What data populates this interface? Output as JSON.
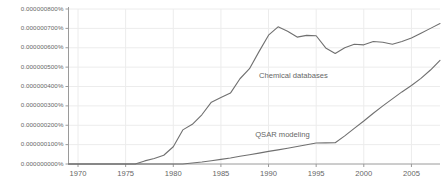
{
  "chart_data": {
    "type": "line",
    "title": "",
    "subtitle": "",
    "xlabel": "",
    "ylabel": "",
    "grid": true,
    "legend_position": "inline-annotation",
    "xlim": [
      1969,
      2008
    ],
    "ylim": [
      0.0,
      8e-07
    ],
    "x_ticks": [
      1970,
      1975,
      1980,
      1985,
      1990,
      1995,
      2000,
      2005
    ],
    "x_tick_labels": [
      "1970",
      "1975",
      "1980",
      "1985",
      "1990",
      "1995",
      "2000",
      "2005"
    ],
    "y_ticks": [
      0.0,
      1e-07,
      2e-07,
      3e-07,
      4e-07,
      5e-07,
      6e-07,
      7e-07,
      8e-07
    ],
    "y_tick_labels": [
      "0.000000000%",
      "0.000000100%",
      "0.000000200%",
      "0.000000300%",
      "0.000000400%",
      "0.000000500%",
      "0.000000600%",
      "0.000000700%",
      "0.000000800%"
    ],
    "x": [
      1969,
      1970,
      1971,
      1972,
      1973,
      1974,
      1975,
      1976,
      1977,
      1978,
      1979,
      1980,
      1981,
      1982,
      1983,
      1984,
      1985,
      1986,
      1987,
      1988,
      1989,
      1990,
      1991,
      1992,
      1993,
      1994,
      1995,
      1996,
      1997,
      1998,
      1999,
      2000,
      2001,
      2002,
      2003,
      2004,
      2005,
      2006,
      2007,
      2008
    ],
    "series": [
      {
        "name": "Chemical databases",
        "color": "#707070",
        "label_x": 1989.0,
        "label_y": 4.55e-07,
        "values": [
          0.0,
          0.0,
          0.0,
          0.0,
          0.0,
          0.0,
          0.0,
          0.0,
          1.6e-08,
          2.8e-08,
          4.5e-08,
          8.9e-08,
          1.76e-07,
          2.05e-07,
          2.54e-07,
          3.19e-07,
          3.43e-07,
          3.66e-07,
          4.4e-07,
          4.92e-07,
          5.8e-07,
          6.65e-07,
          7.08e-07,
          6.85e-07,
          6.55e-07,
          6.64e-07,
          6.62e-07,
          5.99e-07,
          5.7e-07,
          6e-07,
          6.18e-07,
          6.15e-07,
          6.32e-07,
          6.28e-07,
          6.18e-07,
          6.32e-07,
          6.5e-07,
          6.75e-07,
          7e-07,
          7.25e-07
        ]
      },
      {
        "name": "QSAR modeling",
        "color": "#707070",
        "label_x": 1988.6,
        "label_y": 1.48e-07,
        "values": [
          0.0,
          0.0,
          0.0,
          0.0,
          0.0,
          0.0,
          0.0,
          0.0,
          0.0,
          0.0,
          0.0,
          0.0,
          0.0,
          5e-09,
          1e-08,
          1.7e-08,
          2.4e-08,
          3.1e-08,
          4e-08,
          4.8e-08,
          5.6e-08,
          6.5e-08,
          7.3e-08,
          8.1e-08,
          9e-08,
          9.9e-08,
          1.08e-07,
          1.09e-07,
          1.1e-07,
          1.45e-07,
          1.84e-07,
          2.22e-07,
          2.62e-07,
          3e-07,
          3.36e-07,
          3.72e-07,
          4.05e-07,
          4.42e-07,
          4.85e-07,
          5.35e-07
        ]
      }
    ]
  }
}
